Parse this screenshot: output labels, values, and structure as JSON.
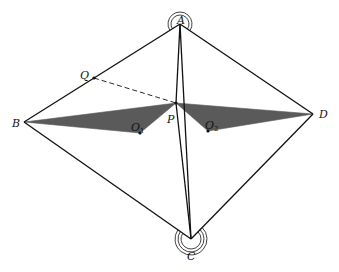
{
  "diagram": {
    "colors": {
      "line": "#111111",
      "fill": "#5a5a5a",
      "background": "#ffffff"
    },
    "points": {
      "A": {
        "x": 180,
        "y": 24,
        "label": "A",
        "sub": "",
        "lx": 177,
        "ly": 20
      },
      "B": {
        "x": 24,
        "y": 122,
        "label": "B",
        "sub": "",
        "lx": 12,
        "ly": 123
      },
      "C": {
        "x": 191,
        "y": 239,
        "label": "C",
        "sub": "",
        "lx": 187,
        "ly": 256
      },
      "D": {
        "x": 313,
        "y": 114,
        "label": "D",
        "sub": "",
        "lx": 319,
        "ly": 114
      },
      "P": {
        "x": 176,
        "y": 103,
        "label": "P",
        "sub": "",
        "lx": 167,
        "ly": 119
      },
      "Q": {
        "x": 94,
        "y": 78,
        "label": "Q",
        "sub": "",
        "lx": 80,
        "ly": 75
      },
      "O1": {
        "x": 140,
        "y": 133,
        "label": "O",
        "sub": "1",
        "lx": 131,
        "ly": 127
      },
      "O2": {
        "x": 208,
        "y": 131,
        "label": "O",
        "sub": "2",
        "lx": 205,
        "ly": 125
      }
    },
    "polygons": [
      {
        "name": "shaded-triangle-B-P-O1",
        "points": [
          "B",
          "P",
          "O1"
        ]
      },
      {
        "name": "shaded-triangle-P-D-O2",
        "points": [
          "P",
          "D",
          "O2"
        ]
      }
    ],
    "segments": [
      {
        "name": "side-AB",
        "from": "A",
        "to": "B",
        "dashed": false
      },
      {
        "name": "side-AD",
        "from": "A",
        "to": "D",
        "dashed": false
      },
      {
        "name": "side-BC",
        "from": "B",
        "to": "C",
        "dashed": false
      },
      {
        "name": "side-CD",
        "from": "C",
        "to": "D",
        "dashed": false
      },
      {
        "name": "segment-AC",
        "from": "A",
        "to": "C",
        "dashed": false
      },
      {
        "name": "segment-AP",
        "from": "A",
        "to": "P",
        "dashed": false
      },
      {
        "name": "segment-PC",
        "from": "P",
        "to": "C",
        "dashed": false
      },
      {
        "name": "segment-QP",
        "from": "Q",
        "to": "P",
        "dashed": true
      }
    ],
    "dots": [
      "P",
      "Q",
      "O1",
      "O2"
    ],
    "angle_marks": [
      {
        "name": "angle-mark-A",
        "vertex": "A",
        "from": "B",
        "to": "D",
        "radii": [
          9,
          12
        ]
      },
      {
        "name": "angle-mark-C",
        "vertex": "C",
        "from": "D",
        "to": "B",
        "radii": [
          10,
          13,
          16
        ]
      }
    ]
  }
}
